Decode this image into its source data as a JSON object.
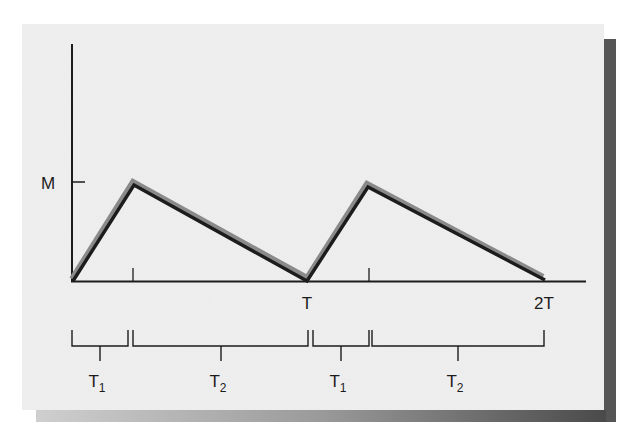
{
  "diagram": {
    "type": "sawtooth-waveform",
    "y_axis_label": "M",
    "x_tick_labels": [
      "T",
      "2T"
    ],
    "interval_labels": [
      {
        "main": "T",
        "sub": "1"
      },
      {
        "main": "T",
        "sub": "2"
      },
      {
        "main": "T",
        "sub": "1"
      },
      {
        "main": "T",
        "sub": "2"
      }
    ],
    "waveform_points": [
      {
        "t": 0,
        "value": 0
      },
      {
        "t": "T1",
        "value": "M"
      },
      {
        "t": "T",
        "value": 0
      },
      {
        "t": "T+T1",
        "value": "M"
      },
      {
        "t": "2T",
        "value": 0
      }
    ],
    "colors": {
      "card": "#eeeeee",
      "shadow": "#555555",
      "line": "#1c1c1c",
      "curve_highlight": "#8a8a8a"
    }
  }
}
